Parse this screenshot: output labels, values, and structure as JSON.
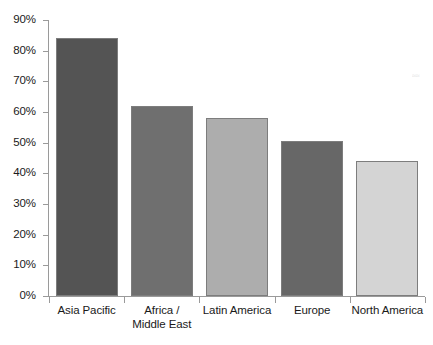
{
  "chart_data": {
    "type": "bar",
    "title": "",
    "subtitle": "",
    "xlabel": "",
    "ylabel": "",
    "categories": [
      "Asia Pacific",
      "Africa / Middle East",
      "Latin America",
      "Europe",
      "North America"
    ],
    "category_lines": [
      [
        "Asia Pacific"
      ],
      [
        "Africa /",
        "Middle East"
      ],
      [
        "Latin America"
      ],
      [
        "Europe"
      ],
      [
        "North America"
      ]
    ],
    "values": [
      84,
      62,
      58,
      50.5,
      44
    ],
    "value_labels": [
      "84%",
      "62%",
      "58%",
      "50.5%",
      "44%"
    ],
    "bar_colors": [
      "#545454",
      "#6f6f6f",
      "#adadad",
      "#676767",
      "#d4d4d4"
    ],
    "bar_border_color": "#7d7d7d",
    "ylim": [
      0,
      90
    ],
    "ytick_values": [
      0,
      10,
      20,
      30,
      40,
      50,
      60,
      70,
      80,
      90
    ],
    "ytick_labels": [
      "0%",
      "10%",
      "20%",
      "30%",
      "40%",
      "50%",
      "60%",
      "70%",
      "80%",
      "90%"
    ],
    "grid": false,
    "legend": false,
    "legend_position": "none",
    "axis_color": "#9a9a9a",
    "background_color": "#ffffff"
  },
  "artifact": {
    "text": "≈≈"
  }
}
